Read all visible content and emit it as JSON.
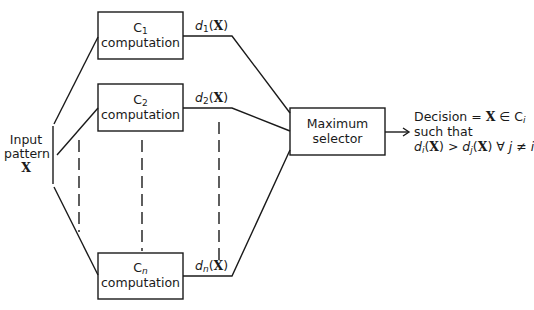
{
  "diagram": {
    "title": "",
    "input": {
      "line1": "Input",
      "line2": "pattern",
      "symbol": "X"
    },
    "blocks": [
      {
        "id": "c1",
        "class_symbol": "C",
        "subscript": "1",
        "label": "computation",
        "output": {
          "func": "d",
          "sub": "1",
          "arg": "X"
        }
      },
      {
        "id": "c2",
        "class_symbol": "C",
        "subscript": "2",
        "label": "computation",
        "output": {
          "func": "d",
          "sub": "2",
          "arg": "X"
        }
      },
      {
        "id": "cn",
        "class_symbol": "C",
        "subscript": "n",
        "label": "computation",
        "output": {
          "func": "d",
          "sub": "n",
          "arg": "X"
        }
      }
    ],
    "selector": {
      "line1": "Maximum",
      "line2": "selector"
    },
    "decision": {
      "line1_prefix": "Decision = ",
      "line1_x": "X",
      "line1_in": " ∈ C",
      "line1_sub": "i",
      "line2": "such that",
      "line3": {
        "d1": "d",
        "s1": "i",
        "x1": "X",
        "gt": " > ",
        "d2": "d",
        "s2": "j",
        "x2": "X",
        "forall": " ∀ ",
        "j": "j",
        "neq": " ≠ ",
        "i": "i"
      }
    },
    "colors": {
      "line": "#1a1a1a",
      "background": "#ffffff"
    }
  }
}
